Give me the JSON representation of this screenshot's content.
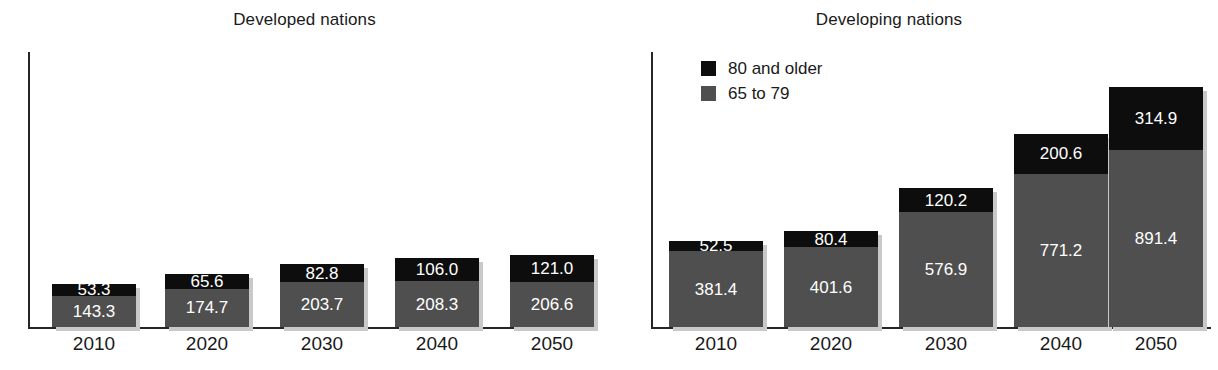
{
  "chart_data": {
    "type": "bar",
    "subtitle": "",
    "xlabel": "",
    "ylabel": "",
    "grid": false,
    "stacked": true,
    "legend_position": "top-left of right panel",
    "categories": [
      "2010",
      "2020",
      "2030",
      "2040",
      "2050"
    ],
    "colors": {
      "80 and older": "#0d0d0d",
      "65 to 79": "#4f4f4f",
      "axis": "#262626",
      "text": "#1a1a1a",
      "background": "#ffffff",
      "bar_shadow": "#c9c9c9"
    },
    "panels": [
      {
        "name": "developed",
        "title": "Developed nations",
        "ylim": [
          0,
          340
        ],
        "series": [
          {
            "name": "65 to 79",
            "values": [
              143.3,
              174.7,
              203.7,
              208.3,
              206.6
            ]
          },
          {
            "name": "80 and older",
            "values": [
              53.3,
              65.6,
              82.8,
              106.0,
              121.0
            ]
          }
        ],
        "totals": [
          196.6,
          240.3,
          286.5,
          314.3,
          327.6
        ]
      },
      {
        "name": "developing",
        "title": "Developing nations",
        "ylim": [
          0,
          1250
        ],
        "series": [
          {
            "name": "65 to 79",
            "values": [
              381.4,
              401.6,
              576.9,
              771.2,
              891.4
            ]
          },
          {
            "name": "80 and older",
            "values": [
              52.5,
              80.4,
              120.2,
              200.6,
              314.9
            ]
          }
        ],
        "totals": [
          433.9,
          482.0,
          697.1,
          971.8,
          1206.3
        ]
      }
    ],
    "legend": [
      {
        "label": "80 and older",
        "color": "#0d0d0d"
      },
      {
        "label": "65 to 79",
        "color": "#4f4f4f"
      }
    ]
  },
  "panel_developed": {
    "title": "Developed nations",
    "ticks": [
      "2010",
      "2020",
      "2030",
      "2040",
      "2050"
    ],
    "bars": [
      {
        "year": "2010",
        "old_label": "53.3",
        "mid_label": "143.3"
      },
      {
        "year": "2020",
        "old_label": "65.6",
        "mid_label": "174.7"
      },
      {
        "year": "2030",
        "old_label": "82.8",
        "mid_label": "203.7"
      },
      {
        "year": "2040",
        "old_label": "106.0",
        "mid_label": "208.3"
      },
      {
        "year": "2050",
        "old_label": "121.0",
        "mid_label": "206.6"
      }
    ]
  },
  "panel_developing": {
    "title": "Developing nations",
    "ticks": [
      "2010",
      "2020",
      "2030",
      "2040",
      "2050"
    ],
    "bars": [
      {
        "year": "2010",
        "old_label": "52.5",
        "mid_label": "381.4"
      },
      {
        "year": "2020",
        "old_label": "80.4",
        "mid_label": "401.6"
      },
      {
        "year": "2030",
        "old_label": "120.2",
        "mid_label": "576.9"
      },
      {
        "year": "2040",
        "old_label": "200.6",
        "mid_label": "771.2"
      },
      {
        "year": "2050",
        "old_label": "314.9",
        "mid_label": "891.4"
      }
    ],
    "legend": {
      "item_old": "80 and older",
      "item_mid": "65 to 79"
    }
  }
}
